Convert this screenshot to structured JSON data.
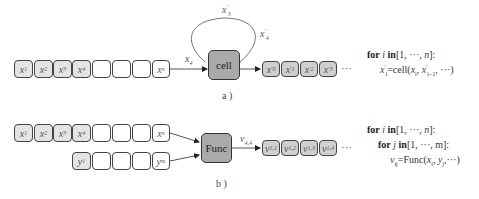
{
  "panel_a": {
    "input_boxes": [
      {
        "var": "x",
        "sub": "1",
        "filled": true
      },
      {
        "var": "x",
        "sub": "2",
        "filled": true
      },
      {
        "var": "x",
        "sub": "3",
        "filled": true
      },
      {
        "var": "x",
        "sub": "4",
        "filled": true
      },
      {
        "var": "",
        "sub": "",
        "filled": false
      },
      {
        "var": "",
        "sub": "",
        "filled": false
      },
      {
        "var": "",
        "sub": "",
        "filled": false
      },
      {
        "var": "x",
        "sub": "n",
        "filled": false
      }
    ],
    "input_edge_label": {
      "var": "x",
      "sub": "4"
    },
    "loop_label": {
      "var": "x",
      "sub": "3",
      "sup": "'"
    },
    "output_edge_label": {
      "var": "x",
      "sub": "4",
      "sup": "'"
    },
    "processor": "cell",
    "output_boxes": [
      {
        "var": "x",
        "sub": "0",
        "sup": "'"
      },
      {
        "var": "x",
        "sub": "1",
        "sup": "'"
      },
      {
        "var": "x",
        "sub": "2",
        "sup": "'"
      },
      {
        "var": "x",
        "sub": "3",
        "sup": "'"
      }
    ],
    "ellipsis": "···",
    "caption": "a )",
    "code": {
      "line1": {
        "for": "for",
        "var": "i",
        "in": "in",
        "range": "[1, ···, ",
        "end": "n",
        "close": "]:"
      },
      "line2": {
        "lhs": "x",
        "lhs_sub": "i",
        "lhs_sup": "'",
        "eq": "=cell(",
        "a1": "x",
        "a1_sub": "i",
        "sep": ", ",
        "a2": "x",
        "a2_sub": "i−1",
        "a2_sup": "'",
        "rest": ", ···)"
      }
    }
  },
  "panel_b": {
    "x_boxes": [
      {
        "var": "x",
        "sub": "1",
        "filled": true
      },
      {
        "var": "x",
        "sub": "2",
        "filled": true
      },
      {
        "var": "x",
        "sub": "3",
        "filled": true
      },
      {
        "var": "x",
        "sub": "4",
        "filled": true
      },
      {
        "var": "",
        "sub": "",
        "filled": false
      },
      {
        "var": "",
        "sub": "",
        "filled": false
      },
      {
        "var": "",
        "sub": "",
        "filled": false
      },
      {
        "var": "x",
        "sub": "n",
        "filled": false
      }
    ],
    "y_boxes": [
      {
        "var": "y",
        "sub": "1",
        "filled": true
      },
      {
        "var": "",
        "sub": "",
        "filled": false
      },
      {
        "var": "",
        "sub": "",
        "filled": false
      },
      {
        "var": "",
        "sub": "",
        "filled": false
      },
      {
        "var": "y",
        "sub": "m",
        "filled": false
      }
    ],
    "processor": "Func",
    "output_edge_label": {
      "var": "v",
      "sub": "4,4"
    },
    "output_boxes": [
      {
        "var": "v",
        "sub": "1,1"
      },
      {
        "var": "v",
        "sub": "1,2"
      },
      {
        "var": "v",
        "sub": "1,3"
      },
      {
        "var": "v",
        "sub": "1,4"
      }
    ],
    "ellipsis": "···",
    "caption": "b )",
    "code": {
      "line1": {
        "for": "for",
        "var": "i",
        "in": "in",
        "range": "[1, ···, ",
        "end": "n",
        "close": "]:"
      },
      "line2": {
        "for": "for",
        "var": "j",
        "in": "in",
        "range": "[1, ···, m]:"
      },
      "line3": {
        "lhs": "v",
        "lhs_sub": "ij",
        "eq": "=Func(",
        "a1": "x",
        "a1_sub": "i",
        "sep": ", ",
        "a2": "y",
        "a2_sub": "j",
        "rest": ",···)"
      }
    }
  }
}
